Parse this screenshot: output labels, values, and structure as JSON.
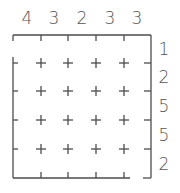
{
  "puzzle": {
    "type": "skyscraper-style grid",
    "rows": 5,
    "cols": 5,
    "top_clues": [
      "4",
      "3",
      "2",
      "3",
      "3"
    ],
    "right_clues": [
      "1",
      "2",
      "5",
      "5",
      "2"
    ],
    "cells": [
      [
        "",
        "",
        "",
        "",
        ""
      ],
      [
        "",
        "",
        "",
        "",
        ""
      ],
      [
        "",
        "",
        "",
        "",
        ""
      ],
      [
        "",
        "",
        "",
        "",
        ""
      ],
      [
        "",
        "",
        "",
        "",
        ""
      ]
    ]
  },
  "colors": {
    "line": "#4d4d4d",
    "text": "#555555",
    "background": "#ffffff"
  }
}
